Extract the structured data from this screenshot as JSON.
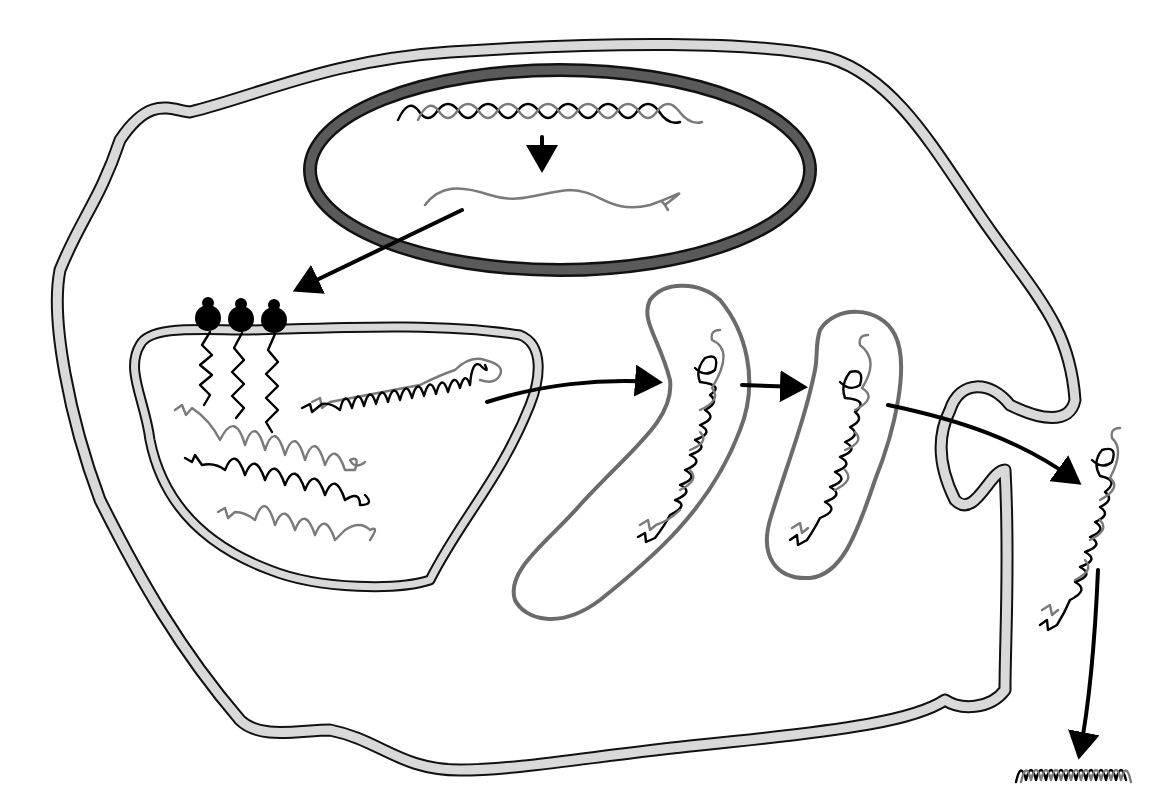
{
  "diagram": {
    "type": "cell protein secretion pathway",
    "text_labels": [],
    "colors": {
      "background": "#ffffff",
      "membrane_fill": "#d9d9d9",
      "outline": "#111111",
      "nuclear_envelope": "#5a5a5a",
      "golgi_outline": "#6b6b6b",
      "gray_strand": "#7a7a7a",
      "ribosome": "#000000"
    },
    "stages": [
      {
        "id": "dna",
        "depicts": "double-helix DNA inside nucleus"
      },
      {
        "id": "transcription",
        "depicts": "arrow from DNA to mRNA"
      },
      {
        "id": "mrna",
        "depicts": "single-stranded mRNA in nucleus"
      },
      {
        "id": "export",
        "depicts": "arrow from mRNA to ribosomes"
      },
      {
        "id": "ribosomes",
        "count": 3,
        "depicts": "ribosomes on rough ER membrane"
      },
      {
        "id": "er",
        "depicts": "endoplasmic reticulum with nascent chains folding into triple helix"
      },
      {
        "id": "golgi_cis",
        "depicts": "first Golgi cisterna with procollagen"
      },
      {
        "id": "golgi_trans",
        "depicts": "second Golgi cisterna with procollagen"
      },
      {
        "id": "secretion",
        "depicts": "procollagen leaving cell through membrane fold"
      },
      {
        "id": "fibril",
        "depicts": "processed collagen triple helix outside cell"
      }
    ]
  }
}
